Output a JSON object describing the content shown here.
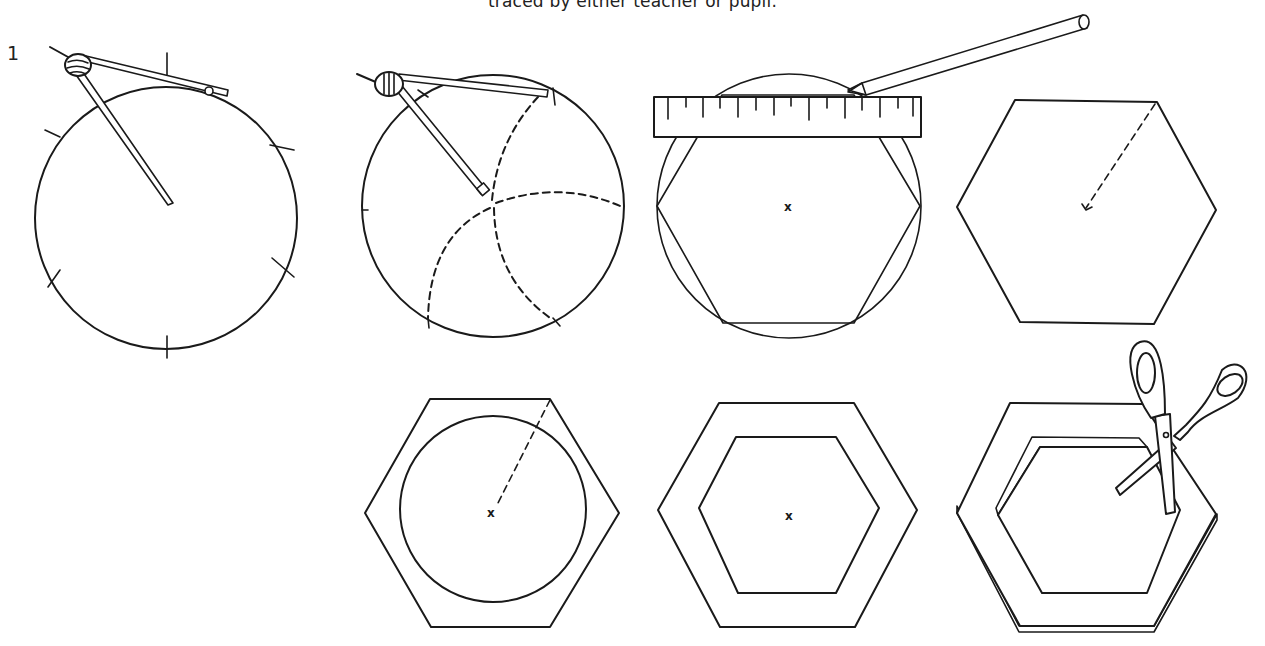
{
  "page": {
    "caption": "traced by either teacher or pupil.",
    "step_number": "1"
  },
  "figures": [
    {
      "id": "fig-1",
      "label": "compass-marking-six-points-on-circle",
      "elements": [
        "circle",
        "compass",
        "6 arc tick marks"
      ]
    },
    {
      "id": "fig-2",
      "label": "compass-drawing-petal-arcs",
      "elements": [
        "circle",
        "compass",
        "dashed arcs from center"
      ]
    },
    {
      "id": "fig-3",
      "label": "ruler-and-pencil-joining-points",
      "elements": [
        "circle",
        "inscribed hexagon",
        "ruler",
        "pencil",
        "center mark"
      ]
    },
    {
      "id": "fig-4",
      "label": "hexagon-with-radius",
      "elements": [
        "hexagon",
        "dashed radius to center"
      ]
    },
    {
      "id": "fig-5",
      "label": "hexagon-with-inner-circle",
      "elements": [
        "hexagon",
        "inner circle",
        "dashed radius",
        "center mark"
      ]
    },
    {
      "id": "fig-6",
      "label": "hexagon-frame",
      "elements": [
        "outer hexagon",
        "inner hexagon",
        "center mark"
      ]
    },
    {
      "id": "fig-7",
      "label": "cutting-out-hexagon-frame",
      "elements": [
        "3d hexagon frame",
        "scissors"
      ]
    }
  ],
  "marks": {
    "center": "x"
  },
  "colors": {
    "ink": "#1a1a1a",
    "paper": "#ffffff"
  }
}
